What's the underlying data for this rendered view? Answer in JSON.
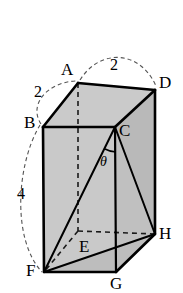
{
  "figure": {
    "type": "geometry-diagram",
    "shape_name": "rectangular-box",
    "background_color": "#ffffff",
    "line_color": "#000000",
    "face_fill_color": "#c8c8c8",
    "hidden_line_style": "dashed",
    "vertices": [
      {
        "id": "A",
        "label": "A",
        "x": 78,
        "y": 83,
        "hidden": false,
        "label_x": 61,
        "label_y": 61
      },
      {
        "id": "B",
        "label": "B",
        "x": 43,
        "y": 127,
        "hidden": false,
        "label_x": 24,
        "label_y": 114
      },
      {
        "id": "C",
        "label": "C",
        "x": 115,
        "y": 127,
        "hidden": false,
        "label_x": 119,
        "label_y": 122
      },
      {
        "id": "D",
        "label": "D",
        "x": 155,
        "y": 90,
        "hidden": false,
        "label_x": 159,
        "label_y": 74
      },
      {
        "id": "E",
        "label": "E",
        "x": 78,
        "y": 231,
        "hidden": true,
        "label_x": 79,
        "label_y": 238
      },
      {
        "id": "F",
        "label": "F",
        "x": 44,
        "y": 272,
        "hidden": false,
        "label_x": 26,
        "label_y": 262
      },
      {
        "id": "G",
        "label": "G",
        "x": 116,
        "y": 272,
        "hidden": false,
        "label_x": 110,
        "label_y": 275
      },
      {
        "id": "H",
        "label": "H",
        "x": 155,
        "y": 234,
        "hidden": false,
        "label_x": 159,
        "label_y": 225
      }
    ],
    "dimension_labels": [
      {
        "id": "edge-BA",
        "value": "2",
        "x": 34,
        "y": 84,
        "arc_from": "F",
        "arc_to": "A"
      },
      {
        "id": "edge-AD",
        "value": "2",
        "x": 110,
        "y": 57,
        "arc_from": "A",
        "arc_to": "D"
      },
      {
        "id": "edge-BF",
        "value": "4",
        "x": 17,
        "y": 186,
        "arc_from": "B",
        "arc_to": "F"
      }
    ],
    "angle": {
      "id": "angle-theta",
      "label": "θ",
      "vertex": "C",
      "label_x": 100,
      "label_y": 155
    }
  }
}
